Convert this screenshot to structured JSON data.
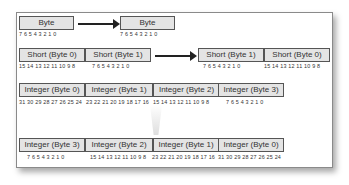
{
  "diagram": {
    "rows": [
      {
        "name": "byte",
        "source": [
          {
            "label": "Byte",
            "bits": "7 6 5 4 3 2 1 0"
          }
        ],
        "target": [
          {
            "label": "Byte",
            "bits": "7 6 5 4 3 2 1 0"
          }
        ]
      },
      {
        "name": "short",
        "source": [
          {
            "label": "Short (Byte 0)",
            "bits": "15 14 13 12 11 10 9 8"
          },
          {
            "label": "Short (Byte 1)",
            "bits": "7 6 5 4 3 2 1 0"
          }
        ],
        "target": [
          {
            "label": "Short (Byte 1)",
            "bits": "7 6 5 4 3 2 1 0"
          },
          {
            "label": "Short (Byte 0)",
            "bits": "15 14 13 12 11 10 9 8"
          }
        ]
      },
      {
        "name": "integer",
        "source": [
          {
            "label": "Integer (Byte 0)",
            "bits": "31 30 29 28 27 26 25 24"
          },
          {
            "label": "Integer (Byte 1)",
            "bits": "23 22 21 20 19 18 17 16"
          },
          {
            "label": "Integer (Byte 2)",
            "bits": "15 14 13 12 11 10 9 8"
          },
          {
            "label": "Integer (Byte 3)",
            "bits": "7 6 5 4 3 2 1 0"
          }
        ],
        "target": [
          {
            "label": "Integer (Byte 3)",
            "bits": "7 6 5 4 3 2 1 0"
          },
          {
            "label": "Integer (Byte 2)",
            "bits": "15 14 13 12 11 10 9 8"
          },
          {
            "label": "Integer (Byte 1)",
            "bits": "23 22 21 20 19 18 17 16"
          },
          {
            "label": "Integer (Byte 0)",
            "bits": "31 30 29 28 27 26 25 24"
          }
        ]
      }
    ]
  }
}
